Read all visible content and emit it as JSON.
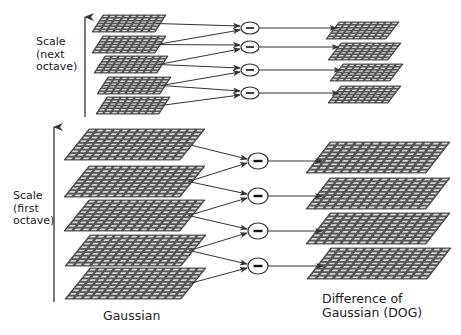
{
  "diagram": {
    "colors": {
      "grid_fill": "#555555",
      "grid_cell": "#d8d8d8",
      "line": "#333333",
      "background": "#ffffff"
    },
    "labels": {
      "next_octave": [
        "Scale",
        "(next",
        "octave)"
      ],
      "first_octave": [
        "Scale",
        "(first",
        "octave)"
      ],
      "gaussian": "Gaussian",
      "dog_line1": "Difference of",
      "dog_line2": "Gaussian (DOG)"
    },
    "operator_symbol": "minus",
    "octaves": [
      {
        "name": "next octave",
        "gaussian_count": 5,
        "dog_count": 4,
        "gaussian_planes": [
          {
            "y": 15,
            "h": 17,
            "x": 92,
            "w": 63,
            "skew": 11
          },
          {
            "y": 36,
            "h": 17,
            "x": 92,
            "w": 63,
            "skew": 11
          },
          {
            "y": 56,
            "h": 17,
            "x": 94,
            "w": 63,
            "skew": 11
          },
          {
            "y": 77,
            "h": 17,
            "x": 97,
            "w": 63,
            "skew": 11
          },
          {
            "y": 97,
            "h": 17,
            "x": 96,
            "w": 63,
            "skew": 11
          }
        ],
        "subtract_nodes": [
          {
            "x": 250,
            "y": 28
          },
          {
            "x": 250,
            "y": 47
          },
          {
            "x": 250,
            "y": 70
          },
          {
            "x": 250,
            "y": 93
          }
        ],
        "dog_planes": [
          {
            "y": 22,
            "h": 17,
            "x": 326,
            "w": 60,
            "skew": 13
          },
          {
            "y": 43,
            "h": 17,
            "x": 328,
            "w": 60,
            "skew": 13
          },
          {
            "y": 64,
            "h": 17,
            "x": 330,
            "w": 60,
            "skew": 13
          },
          {
            "y": 86,
            "h": 17,
            "x": 328,
            "w": 60,
            "skew": 13
          }
        ],
        "axis": {
          "x": 85,
          "y1": 117,
          "y2": 15
        },
        "grid": {
          "cols": 9,
          "rows": 6
        }
      },
      {
        "name": "first octave",
        "gaussian_count": 5,
        "dog_count": 4,
        "gaussian_planes": [
          {
            "y": 129,
            "h": 31,
            "x": 64,
            "w": 116,
            "skew": 25
          },
          {
            "y": 166,
            "h": 31,
            "x": 64,
            "w": 116,
            "skew": 25
          },
          {
            "y": 200,
            "h": 31,
            "x": 64,
            "w": 116,
            "skew": 25
          },
          {
            "y": 235,
            "h": 31,
            "x": 65,
            "w": 116,
            "skew": 25
          },
          {
            "y": 268,
            "h": 31,
            "x": 65,
            "w": 116,
            "skew": 25
          }
        ],
        "subtract_nodes": [
          {
            "x": 258,
            "y": 161
          },
          {
            "x": 258,
            "y": 196
          },
          {
            "x": 258,
            "y": 231
          },
          {
            "x": 258,
            "y": 266
          }
        ],
        "dog_planes": [
          {
            "y": 142,
            "h": 31,
            "x": 306,
            "w": 120,
            "skew": 24
          },
          {
            "y": 178,
            "h": 31,
            "x": 306,
            "w": 120,
            "skew": 24
          },
          {
            "y": 213,
            "h": 31,
            "x": 306,
            "w": 120,
            "skew": 24
          },
          {
            "y": 248,
            "h": 31,
            "x": 307,
            "w": 120,
            "skew": 24
          }
        ],
        "axis": {
          "x": 54,
          "y1": 302,
          "y2": 125
        },
        "grid": {
          "cols": 14,
          "rows": 9
        }
      }
    ]
  }
}
